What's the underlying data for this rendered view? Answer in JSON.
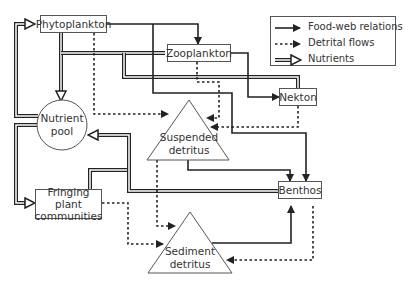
{
  "nodes": {
    "phytoplankton": "Phytoplankton",
    "zooplankton": "Zooplankton",
    "nekton": "Nekton",
    "nutrient_pool_line1": "Nutrient",
    "nutrient_pool_line2": "pool",
    "suspended_detritus_line1": "Suspended",
    "suspended_detritus_line2": "detritus",
    "benthos": "Benthos",
    "fringing_line1": "Fringing plant",
    "fringing_line2": "communities",
    "sediment_detritus_line1": "Sediment",
    "sediment_detritus_line2": "detritus"
  },
  "legend": {
    "food_web": "Food-web relations",
    "detrital": "Detrital flows",
    "nutrients": "Nutrients"
  },
  "colors": {
    "line": "#222222",
    "box_border": "#555555",
    "text": "#333333"
  }
}
